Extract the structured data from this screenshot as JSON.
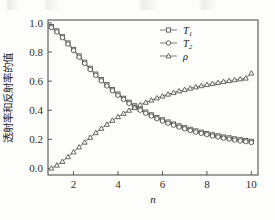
{
  "figure": {
    "name": "transmittance-reflectance-plot",
    "background_color": "#fdfdfc",
    "line_color": "#6d6b67",
    "marker_face_color": "#ffffff",
    "marker_edge_color": "#4c4a47",
    "axis_color": "#55534f"
  },
  "axes": {
    "x_title": "n",
    "y_title": "透射率和反射率的值",
    "x_ticklabels": [
      "2",
      "4",
      "6",
      "8",
      "10"
    ],
    "x_tickvalues": [
      2,
      4,
      6,
      8,
      10
    ],
    "y_ticklabels": [
      "0.0",
      "0.2",
      "0.4",
      "0.6",
      "0.8",
      "1.0"
    ],
    "y_tickvalues": [
      0.0,
      0.2,
      0.4,
      0.6,
      0.8,
      1.0
    ]
  },
  "legend": {
    "position": "top-right-inside",
    "entries": [
      {
        "label": "T",
        "subscript": "1",
        "marker": "square-open-icon"
      },
      {
        "label": "T",
        "subscript": "2",
        "marker": "circle-open-icon"
      },
      {
        "label": "ρ",
        "subscript": "",
        "marker": "triangle-open-icon"
      }
    ]
  },
  "chart_data": {
    "type": "line",
    "title": "",
    "xlabel": "n",
    "ylabel": "透射率和反射率的值",
    "xlim": [
      0.85,
      10.3
    ],
    "ylim": [
      -0.045,
      1.02
    ],
    "grid": false,
    "legend_position": "upper right",
    "x": [
      1.0,
      1.25,
      1.5,
      1.75,
      2.0,
      2.25,
      2.5,
      2.75,
      3.0,
      3.25,
      3.5,
      3.75,
      4.0,
      4.25,
      4.5,
      4.75,
      5.0,
      5.25,
      5.5,
      5.75,
      6.0,
      6.25,
      6.5,
      6.75,
      7.0,
      7.25,
      7.5,
      7.75,
      8.0,
      8.25,
      8.5,
      8.75,
      9.0,
      9.25,
      9.5,
      9.75,
      10.0
    ],
    "series": [
      {
        "name": "T1",
        "marker": "square-open",
        "values": [
          0.975,
          0.945,
          0.905,
          0.862,
          0.818,
          0.773,
          0.73,
          0.688,
          0.648,
          0.61,
          0.575,
          0.542,
          0.511,
          0.482,
          0.455,
          0.43,
          0.408,
          0.387,
          0.368,
          0.35,
          0.334,
          0.319,
          0.305,
          0.292,
          0.28,
          0.269,
          0.258,
          0.249,
          0.24,
          0.231,
          0.224,
          0.216,
          0.21,
          0.203,
          0.197,
          0.192,
          0.186
        ]
      },
      {
        "name": "T2",
        "marker": "circle-open",
        "values": [
          0.968,
          0.938,
          0.898,
          0.855,
          0.81,
          0.765,
          0.722,
          0.68,
          0.64,
          0.602,
          0.567,
          0.534,
          0.503,
          0.474,
          0.447,
          0.422,
          0.4,
          0.379,
          0.36,
          0.342,
          0.326,
          0.311,
          0.297,
          0.284,
          0.272,
          0.261,
          0.25,
          0.241,
          0.232,
          0.223,
          0.216,
          0.208,
          0.202,
          0.195,
          0.189,
          0.184,
          0.178
        ]
      },
      {
        "name": "rho",
        "marker": "triangle-open",
        "values": [
          0.002,
          0.022,
          0.048,
          0.08,
          0.113,
          0.147,
          0.18,
          0.213,
          0.245,
          0.275,
          0.303,
          0.33,
          0.355,
          0.378,
          0.399,
          0.419,
          0.437,
          0.454,
          0.469,
          0.484,
          0.497,
          0.51,
          0.521,
          0.532,
          0.542,
          0.551,
          0.56,
          0.568,
          0.576,
          0.583,
          0.59,
          0.597,
          0.603,
          0.609,
          0.615,
          0.62,
          0.655
        ]
      }
    ]
  }
}
